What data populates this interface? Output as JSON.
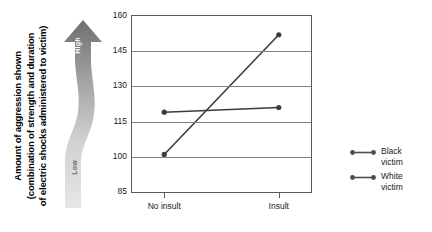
{
  "chart_data": {
    "type": "line",
    "title": "",
    "xlabel": "",
    "ylabel": "Amount of aggression shown (combination of strength and duration of electric shocks administered to victim)",
    "categories": [
      "No insult",
      "Insult"
    ],
    "series": [
      {
        "name": "Black victim",
        "values": [
          119,
          121
        ]
      },
      {
        "name": "White victim",
        "values": [
          101,
          152
        ]
      }
    ],
    "ylim": [
      85,
      160
    ],
    "yticks": [
      85,
      100,
      115,
      130,
      145,
      160
    ],
    "grid": true,
    "legend_position": "right"
  },
  "y_axis_title": {
    "line1": "Amount of aggression shown",
    "line2": "(combination of strength and duration",
    "line3": "of electric shocks administered to victim)"
  },
  "magnitude_arrow": {
    "high_label": "High",
    "low_label": "Low",
    "top_color": "#777777",
    "bottom_color": "#e3e3e3"
  },
  "axis": {
    "y_tick_labels": [
      "160",
      "145",
      "130",
      "115",
      "100",
      "85"
    ],
    "x_tick_labels": [
      "No insult",
      "Insult"
    ]
  },
  "legend": {
    "items": [
      {
        "label": "Black\nvictim",
        "color": "#4d4d4d"
      },
      {
        "label": "White\nvictim",
        "color": "#4d4d4d"
      }
    ]
  },
  "colors": {
    "line": "#3c3c3c",
    "grid": "#808080",
    "frame": "#5a5a5a"
  }
}
